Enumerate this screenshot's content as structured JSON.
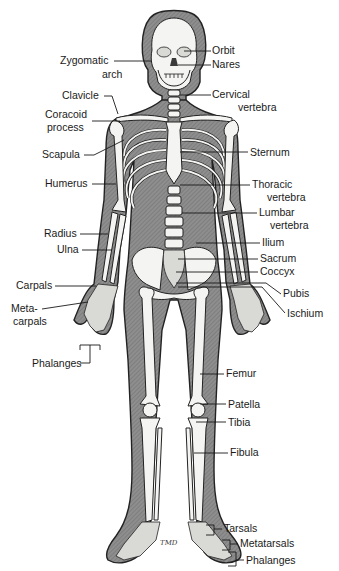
{
  "figure": {
    "signature": "TMD"
  },
  "labels": {
    "left": {
      "zygomatic_arch": [
        "Zygomatic",
        "arch"
      ],
      "clavicle": "Clavicle",
      "coracoid_process": [
        "Coracoid",
        "process"
      ],
      "scapula": "Scapula",
      "humerus": "Humerus",
      "radius": "Radius",
      "ulna": "Ulna",
      "carpals": "Carpals",
      "metacarpals": [
        "Meta-",
        "carpals"
      ],
      "phalanges": "Phalanges"
    },
    "right": {
      "orbit": "Orbit",
      "nares": "Nares",
      "cervical_vertebra": [
        "Cervical",
        "vertebra"
      ],
      "sternum": "Sternum",
      "thoracic_vertebra": [
        "Thoracic",
        "vertebra"
      ],
      "lumbar_vertebra": [
        "Lumbar",
        "vertebra"
      ],
      "ilium": "Ilium",
      "sacrum": "Sacrum",
      "coccyx": "Coccyx",
      "pubis": "Pubis",
      "ischium": "Ischium",
      "femur": "Femur",
      "patella": "Patella",
      "tibia": "Tibia",
      "fibula": "Fibula",
      "tarsals": "Tarsals",
      "metatarsals": "Metatarsals",
      "phalanges": "Phalanges"
    }
  },
  "colors": {
    "flesh": "#8c8c8c",
    "bone": "#f4f4f2",
    "ink": "#1a1a1a",
    "background": "#ffffff"
  }
}
